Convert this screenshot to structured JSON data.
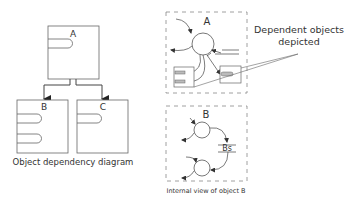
{
  "left_diagram": {
    "caption": "Object dependency diagram",
    "objects": [
      {
        "id": "A",
        "label": "A",
        "slots": 1
      },
      {
        "id": "B",
        "label": "B",
        "slots": 2
      },
      {
        "id": "C",
        "label": "C",
        "slots": 1
      }
    ],
    "dependencies": [
      {
        "from": "A",
        "to": "B"
      },
      {
        "from": "A",
        "to": "C"
      }
    ]
  },
  "right_diagram": {
    "object_a": {
      "label": "A"
    },
    "object_b": {
      "label": "B",
      "caption": "Internal view of object B",
      "store_label": "Bs"
    },
    "callout": {
      "line1": "Dependent objects",
      "line2": "depicted"
    }
  },
  "colors": {
    "stroke": "#555555",
    "dashed": "#888888",
    "text": "#333333",
    "slot_fill": "#bbbbbb",
    "background": "#ffffff"
  }
}
